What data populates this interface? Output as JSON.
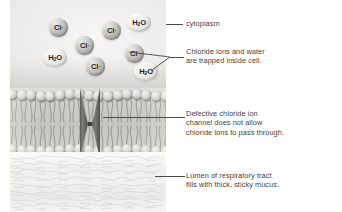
{
  "figure": {
    "background_color": "#ffffff"
  },
  "molecules": [
    {
      "id": "cl-1",
      "species": "Cl",
      "charge": "-",
      "label": "Cl",
      "x": 39,
      "y": 18,
      "size": 19
    },
    {
      "id": "cl-2",
      "species": "Cl",
      "charge": "-",
      "label": "Cl",
      "x": 92,
      "y": 21,
      "size": 19
    },
    {
      "id": "cl-3",
      "species": "Cl",
      "charge": "-",
      "label": "Cl",
      "x": 65,
      "y": 36,
      "size": 19
    },
    {
      "id": "cl-4",
      "species": "Cl",
      "charge": "-",
      "label": "Cl",
      "x": 76,
      "y": 57,
      "size": 19
    },
    {
      "id": "cl-5",
      "species": "Cl",
      "charge": "-",
      "label": "Cl",
      "x": 115,
      "y": 44,
      "size": 19
    },
    {
      "id": "h2o-1",
      "species": "H2O",
      "charge": "",
      "label": "H2O",
      "x": 117,
      "y": 13,
      "size": 24
    },
    {
      "id": "h2o-2",
      "species": "H2O",
      "charge": "",
      "label": "H2O",
      "x": 33,
      "y": 48,
      "size": 24
    },
    {
      "id": "h2o-3",
      "species": "H2O",
      "charge": "",
      "label": "H2O",
      "x": 124,
      "y": 62,
      "size": 24
    }
  ],
  "labels": [
    {
      "id": "cytoplasm",
      "text": "cytoplasm",
      "x": 186,
      "y": 19,
      "leader": {
        "x": 166,
        "y": 24,
        "length": 17
      }
    },
    {
      "id": "trapped-ions",
      "text": "Chloride ions and water\nare trapped inside cell.",
      "x": 186,
      "y": 47,
      "leader": {
        "x": 170,
        "y": 57,
        "length": 14
      }
    },
    {
      "id": "defective-channel",
      "text": "Defective chloride ion\nchannel does not allow\nchloride ions to pass through.",
      "x": 186,
      "y": 109,
      "leader": {
        "x": 103,
        "y": 117,
        "length": 82
      }
    },
    {
      "id": "lumen-mucus",
      "text": "Lumen of respiratory tract\nfills with thick, sticky mucus.",
      "x": 186,
      "y": 171,
      "leader": {
        "x": 155,
        "y": 176,
        "length": 30
      }
    }
  ],
  "regions": {
    "cytoplasm_label": "cytoplasm",
    "membrane_label": "plasma membrane phospholipid bilayer",
    "channel_label": "defective chloride ion channel protein",
    "mucus_label": "lumen with thick sticky mucus"
  },
  "colors": {
    "label_text": "#3f3f3f",
    "leader_line": "#4a4a4a",
    "membrane": "#c6c6c2",
    "channel": "#6d6d69",
    "molecule_text": "#1b1b1b"
  }
}
